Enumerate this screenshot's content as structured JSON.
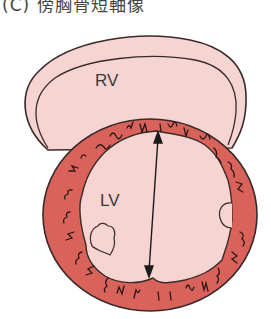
{
  "title": "(C) 傍胸骨短軸像",
  "labels": {
    "rv": "RV",
    "lv": "LV"
  },
  "colors": {
    "chamber_fill": "#f6d4d2",
    "myocardium": "#d9635b",
    "outline": "#3a2a2a",
    "trabeculae": "#2a1818"
  },
  "annotations": {
    "arrow": "double-headed arrow measuring LV internal diameter"
  }
}
